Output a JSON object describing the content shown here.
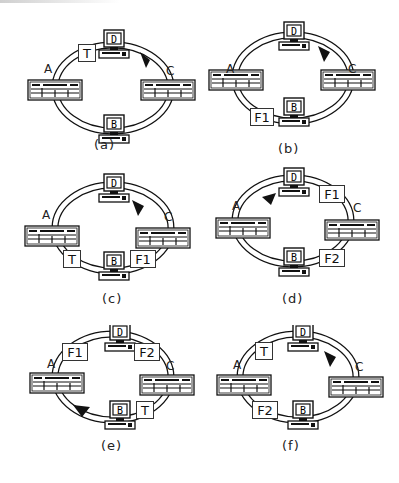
{
  "stations": {
    "A": "A",
    "B": "B",
    "C": "C",
    "D": "D"
  },
  "panels": [
    {
      "caption": "(a)",
      "frames": [
        {
          "label": "T",
          "pos": "between-A-D"
        }
      ],
      "arrow": "clockwise-near-D-C"
    },
    {
      "caption": "(b)",
      "frames": [
        {
          "label": "F1",
          "pos": "between-A-B"
        }
      ],
      "arrow": "clockwise-near-D-C"
    },
    {
      "caption": "(c)",
      "frames": [
        {
          "label": "T",
          "pos": "between-A-B"
        },
        {
          "label": "F1",
          "pos": "between-B-C"
        }
      ],
      "arrow": "clockwise-near-D-C"
    },
    {
      "caption": "(d)",
      "frames": [
        {
          "label": "F1",
          "pos": "between-D-C"
        },
        {
          "label": "F2",
          "pos": "between-C-B"
        }
      ],
      "arrow": "counterclockwise-near-D-A"
    },
    {
      "caption": "(e)",
      "frames": [
        {
          "label": "F1",
          "pos": "between-A-D"
        },
        {
          "label": "F2",
          "pos": "between-D-C"
        },
        {
          "label": "T",
          "pos": "between-C-B"
        }
      ],
      "arrow": "counterclockwise-near-A-B"
    },
    {
      "caption": "(f)",
      "frames": [
        {
          "label": "T",
          "pos": "between-A-D"
        },
        {
          "label": "F2",
          "pos": "between-A-B"
        }
      ],
      "arrow": "clockwise-near-D-C"
    }
  ],
  "icons": {
    "workstation": "computer-terminal-icon",
    "concentrator": "rack-device-icon",
    "direction": "arrowhead-icon"
  },
  "colors": {
    "line": "#222222",
    "ring_fill": "#ffffff",
    "background": "#ffffff"
  }
}
